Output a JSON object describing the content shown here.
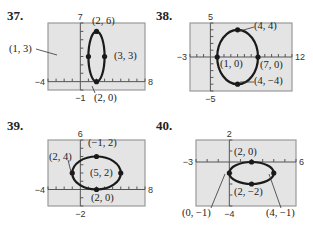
{
  "chart_data": [
    {
      "id": "37",
      "type": "scatter",
      "title": "37.",
      "xlim": [
        -4,
        8
      ],
      "ylim": [
        -1,
        7
      ],
      "tick_labels": {
        "xmin": "-4",
        "xmax": "8",
        "ymin": "-1",
        "ymax": "7"
      },
      "ellipse": {
        "cx": 2,
        "cy": 3,
        "rx": 1,
        "ry": 3
      },
      "points": [
        {
          "x": 2,
          "y": 6,
          "label": "(2, 6)"
        },
        {
          "x": 1,
          "y": 3,
          "label": "(1, 3)"
        },
        {
          "x": 3,
          "y": 3,
          "label": "(3, 3)"
        },
        {
          "x": 2,
          "y": 0,
          "label": "(2, 0)"
        }
      ],
      "grid": false
    },
    {
      "id": "38",
      "type": "scatter",
      "title": "38.",
      "xlim": [
        -3,
        12
      ],
      "ylim": [
        -5,
        5
      ],
      "tick_labels": {
        "xmin": "-3",
        "xmax": "12",
        "ymin": "-5",
        "ymax": "5"
      },
      "ellipse": {
        "cx": 4,
        "cy": 0,
        "rx": 3,
        "ry": 4
      },
      "points": [
        {
          "x": 4,
          "y": 4,
          "label": "(4, 4)"
        },
        {
          "x": 1,
          "y": 0,
          "label": "(1, 0)"
        },
        {
          "x": 7,
          "y": 0,
          "label": "(7, 0)"
        },
        {
          "x": 4,
          "y": -4,
          "label": "(4, -4)"
        }
      ],
      "grid": false
    },
    {
      "id": "39",
      "type": "scatter",
      "title": "39.",
      "xlim": [
        -4,
        8
      ],
      "ylim": [
        -2,
        6
      ],
      "tick_labels": {
        "xmin": "-4",
        "xmax": "8",
        "ymin": "-2",
        "ymax": "6"
      },
      "ellipse": {
        "cx": 2,
        "cy": 2,
        "rx": 3,
        "ry": 2
      },
      "points": [
        {
          "x": 2,
          "y": 4,
          "label": "(2, 4)"
        },
        {
          "x": -1,
          "y": 2,
          "label": "(-1, 2)"
        },
        {
          "x": 5,
          "y": 2,
          "label": "(5, 2)"
        },
        {
          "x": 2,
          "y": 0,
          "label": "(2, 0)"
        }
      ],
      "grid": false
    },
    {
      "id": "40",
      "type": "scatter",
      "title": "40.",
      "xlim": [
        -3,
        6
      ],
      "ylim": [
        -4,
        2
      ],
      "tick_labels": {
        "xmin": "-3",
        "xmax": "6",
        "ymin": "-4",
        "ymax": "2"
      },
      "ellipse": {
        "cx": 2,
        "cy": -1,
        "rx": 2,
        "ry": 1
      },
      "points": [
        {
          "x": 2,
          "y": 0,
          "label": "(2, 0)"
        },
        {
          "x": 0,
          "y": -1,
          "label": "(0, -1)"
        },
        {
          "x": 4,
          "y": -1,
          "label": "(4, -1)"
        },
        {
          "x": 2,
          "y": -2,
          "label": "(2, -2)"
        }
      ],
      "grid": false
    }
  ],
  "colors": {
    "plot_bg": "#e4e4e4",
    "frame": "#9a9a9a",
    "curve": "#1a1a1a",
    "text": "#222222"
  }
}
